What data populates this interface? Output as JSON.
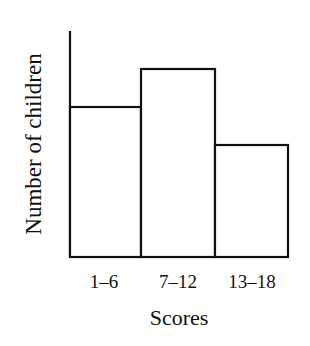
{
  "chart_data": {
    "type": "bar",
    "subtype": "histogram",
    "title": "",
    "xlabel": "Scores",
    "ylabel": "Number of children",
    "categories": [
      "1–6",
      "7–12",
      "13–18"
    ],
    "values": [
      150,
      188,
      112
    ],
    "value_units": "relative bar height (no numeric y-axis ticks shown)",
    "ylim": [
      0,
      226
    ],
    "grid": false,
    "legend": null,
    "y_ticks": []
  },
  "colors": {
    "stroke": "#111111",
    "fill": "#ffffff"
  }
}
